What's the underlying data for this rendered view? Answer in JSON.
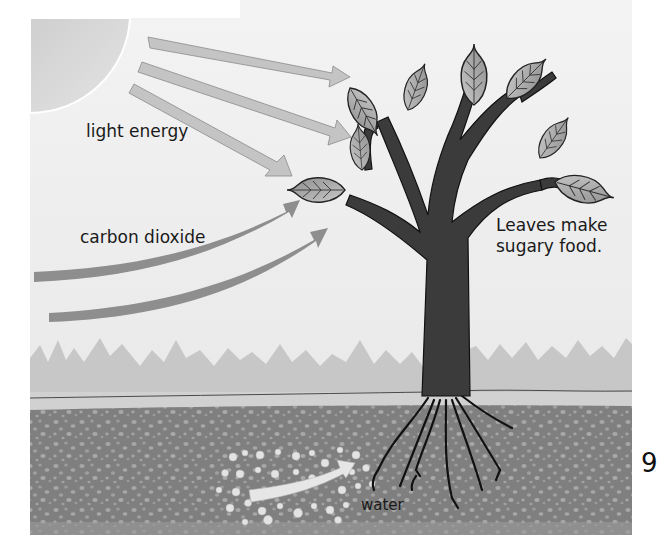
{
  "diagram": {
    "labels": {
      "light": "light energy",
      "carbon_dioxide": "carbon dioxide",
      "leaves_line1": "Leaves make",
      "leaves_line2": "sugary food.",
      "water": "water"
    },
    "page_number": "9",
    "elements": [
      "sun",
      "light-energy-arrows",
      "carbon-dioxide-arrows",
      "tree",
      "leaves",
      "grass",
      "soil",
      "roots",
      "water-droplets",
      "water-arrow"
    ],
    "colors": {
      "background": "#e9e9e9",
      "sun": "#d6d6d6",
      "light_arrow": "#c4c4c4",
      "co2_arrow": "#8d8d8d",
      "trunk": "#3a3a3a",
      "leaf": "#a9a9a9",
      "grass": "#c6c6c6",
      "ground_band": "#cfcfcf",
      "soil": "#7e7e7e",
      "soil_dots": "#a8a8a8",
      "water_dots": "#e2e2e2"
    }
  }
}
